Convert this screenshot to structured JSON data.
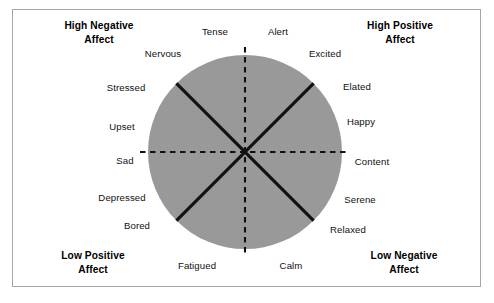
{
  "figure": {
    "type": "circumplex-model-of-affect",
    "title": "",
    "background_color": "#ffffff",
    "frame_color": "#a6a6a6",
    "circle": {
      "fill_color": "#999999",
      "center_x": 245,
      "center_y": 152,
      "radius": 97
    },
    "axes": {
      "style": "dashed",
      "color": "#111111",
      "vertical_label": "arousal",
      "horizontal_label": "valence"
    },
    "diagonals": {
      "style": "solid",
      "color": "#111111",
      "angles_deg": [
        45,
        135
      ]
    }
  },
  "corner_labels": [
    {
      "id": "high-negative-affect",
      "text": "High Negative\nAffect",
      "x": 99,
      "y": 33
    },
    {
      "id": "high-positive-affect",
      "text": "High Positive\nAffect",
      "x": 400,
      "y": 33
    },
    {
      "id": "low-positive-affect",
      "text": "Low Positive\nAffect",
      "x": 93,
      "y": 263
    },
    {
      "id": "low-negative-affect",
      "text": "Low Negative\nAffect",
      "x": 404,
      "y": 263
    }
  ],
  "emotion_labels": [
    {
      "id": "tense",
      "text": "Tense",
      "x": 215,
      "y": 32,
      "angle_deg": 101
    },
    {
      "id": "alert",
      "text": "Alert",
      "x": 278,
      "y": 32,
      "angle_deg": 79
    },
    {
      "id": "nervous",
      "text": "Nervous",
      "x": 163,
      "y": 54,
      "angle_deg": 123
    },
    {
      "id": "excited",
      "text": "Excited",
      "x": 325,
      "y": 54,
      "angle_deg": 57
    },
    {
      "id": "stressed",
      "text": "Stressed",
      "x": 126,
      "y": 88,
      "angle_deg": 143
    },
    {
      "id": "elated",
      "text": "Elated",
      "x": 357,
      "y": 87,
      "angle_deg": 37
    },
    {
      "id": "upset",
      "text": "Upset",
      "x": 122,
      "y": 127,
      "angle_deg": 163
    },
    {
      "id": "happy",
      "text": "Happy",
      "x": 361,
      "y": 122,
      "angle_deg": 17
    },
    {
      "id": "sad",
      "text": "Sad",
      "x": 125,
      "y": 161,
      "angle_deg": 185
    },
    {
      "id": "content",
      "text": "Content",
      "x": 372,
      "y": 162,
      "angle_deg": 356
    },
    {
      "id": "depressed",
      "text": "Depressed",
      "x": 122,
      "y": 198,
      "angle_deg": 208
    },
    {
      "id": "serene",
      "text": "Serene",
      "x": 360,
      "y": 200,
      "angle_deg": 334
    },
    {
      "id": "bored",
      "text": "Bored",
      "x": 137,
      "y": 226,
      "angle_deg": 223
    },
    {
      "id": "relaxed",
      "text": "Relaxed",
      "x": 348,
      "y": 230,
      "angle_deg": 316
    },
    {
      "id": "fatigued",
      "text": "Fatigued",
      "x": 197,
      "y": 266,
      "angle_deg": 257
    },
    {
      "id": "calm",
      "text": "Calm",
      "x": 291,
      "y": 266,
      "angle_deg": 283
    }
  ]
}
